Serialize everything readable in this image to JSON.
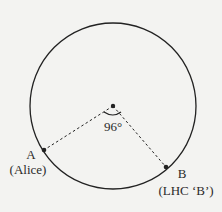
{
  "diagram": {
    "colors": {
      "background": "#f3f3f1",
      "stroke": "#222222"
    },
    "circle": {
      "cx": 113,
      "cy": 106,
      "r": 83
    },
    "center_point": {
      "x": 113,
      "y": 106
    },
    "angle_label": "96°",
    "points": [
      {
        "id": "A",
        "x": 44,
        "y": 150,
        "label": "A",
        "sublabel": "(Alice)"
      },
      {
        "id": "B",
        "x": 166,
        "y": 167,
        "label": "B",
        "sublabel": "(LHC ‘B’)"
      }
    ]
  }
}
